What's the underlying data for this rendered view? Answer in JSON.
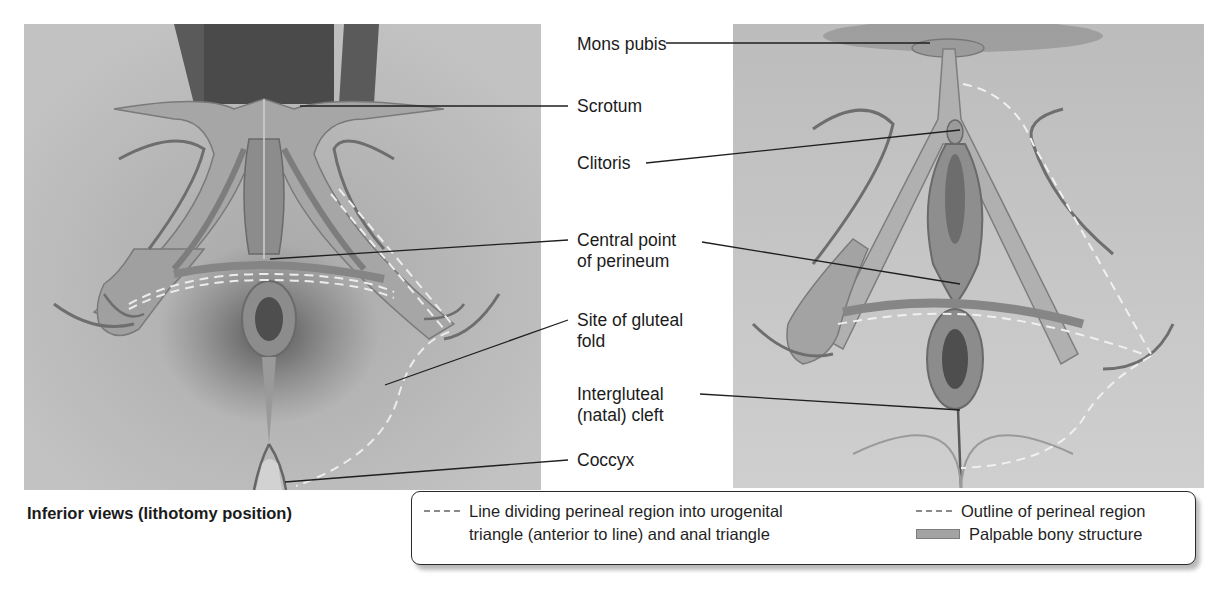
{
  "figure": {
    "caption": "Inferior views (lithotomy position)",
    "panels": [
      {
        "id": "male",
        "view": "inferior view, lithotomy position"
      },
      {
        "id": "female",
        "view": "inferior view, lithotomy position"
      }
    ],
    "labels": {
      "mons_pubis": "Mons pubis",
      "scrotum": "Scrotum",
      "clitoris": "Clitoris",
      "central_point_line1": "Central point",
      "central_point_line2": "of perineum",
      "gluteal_fold_line1": "Site of gluteal",
      "gluteal_fold_line2": "fold",
      "intergluteal_line1": "Intergluteal",
      "intergluteal_line2": "(natal) cleft",
      "coccyx": "Coccyx"
    },
    "legend": {
      "dividing_line_line1": "Line dividing perineal region into urogenital",
      "dividing_line_line2": "triangle (anterior to line) and anal triangle",
      "outline": "Outline of perineal region",
      "bony": "Palpable bony structure"
    },
    "colors": {
      "background": "#ffffff",
      "panel_left": "#b9b9b9",
      "panel_right": "#c6c6c6",
      "bone": "#a3a3a3",
      "muscle": "#7e7e7e",
      "dashed_line": "#e8e8e8",
      "leader_line": "#222222"
    }
  }
}
